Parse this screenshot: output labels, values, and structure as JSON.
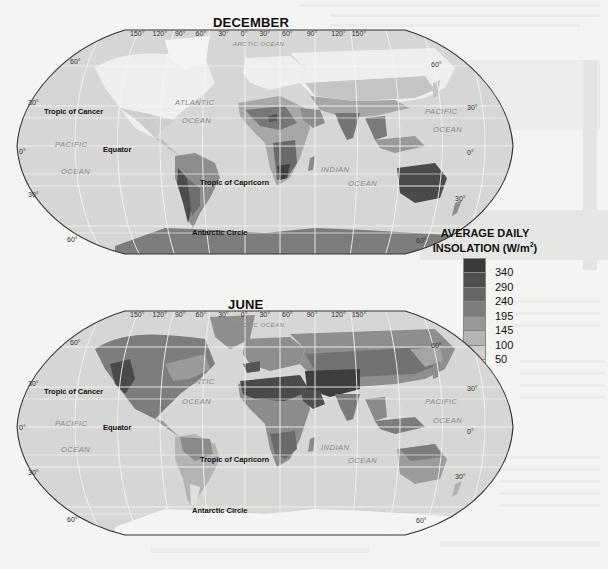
{
  "figure": {
    "maps": [
      {
        "id": "december",
        "title": "DECEMBER",
        "longitude_labels": [
          "150°",
          "120°",
          "90°",
          "60°",
          "30°",
          "0°",
          "30°",
          "60°",
          "90°",
          "120°",
          "150°"
        ],
        "latitude_labels_left": [
          "60°",
          "30°",
          "0°",
          "30°",
          "60°"
        ],
        "latitude_labels_right": [
          "60°",
          "30°",
          "0°",
          "30°",
          "60°"
        ],
        "ocean_labels": {
          "arctic": "ARCTIC OCEAN",
          "atlantic_1": "ATLANTIC",
          "atlantic_2": "OCEAN",
          "pacific_w_1": "PACIFIC",
          "pacific_w_2": "OCEAN",
          "pacific_e_1": "PACIFIC",
          "pacific_e_2": "OCEAN",
          "indian_1": "INDIAN",
          "indian_2": "OCEAN"
        },
        "line_labels": {
          "tropic_cancer": "Tropic of Cancer",
          "equator": "Equator",
          "tropic_capricorn": "Tropic of Capricorn",
          "antarctic_circle": "Antarctic Circle"
        }
      },
      {
        "id": "june",
        "title": "JUNE",
        "longitude_labels": [
          "150°",
          "120°",
          "90°",
          "60°",
          "30°",
          "0°",
          "30°",
          "60°",
          "90°",
          "120°",
          "150°"
        ],
        "latitude_labels_left": [
          "60°",
          "30°",
          "0°",
          "30°",
          "60°"
        ],
        "latitude_labels_right": [
          "60°",
          "30°",
          "0°",
          "30°",
          "60°"
        ],
        "ocean_labels": {
          "arctic": "ARCTIC OCEAN",
          "atlantic_1": "ATLANTIC",
          "atlantic_2": "OCEAN",
          "pacific_w_1": "PACIFIC",
          "pacific_w_2": "OCEAN",
          "pacific_e_1": "PACIFIC",
          "pacific_e_2": "OCEAN",
          "indian_1": "INDIAN",
          "indian_2": "OCEAN"
        },
        "line_labels": {
          "tropic_cancer": "Tropic of Cancer",
          "equator": "Equator",
          "tropic_capricorn": "Tropic of Capricorn",
          "antarctic_circle": "Antarctic Circle"
        }
      }
    ],
    "legend": {
      "title_line1": "AVERAGE DAILY",
      "title_line2": "INSOLATION (W/m",
      "title_sup": "2",
      "title_close": ")",
      "ticks": [
        "340",
        "290",
        "240",
        "195",
        "145",
        "100",
        "50"
      ],
      "colors": [
        "#3a3a3a",
        "#4e4e4e",
        "#666666",
        "#7d7d7d",
        "#979797",
        "#b4b4b4",
        "#cfcfcf",
        "#f2f2f2"
      ]
    },
    "colors": {
      "ocean": "#d6d6d4",
      "outline": "#333333",
      "graticule": "#f2f2f2"
    }
  }
}
